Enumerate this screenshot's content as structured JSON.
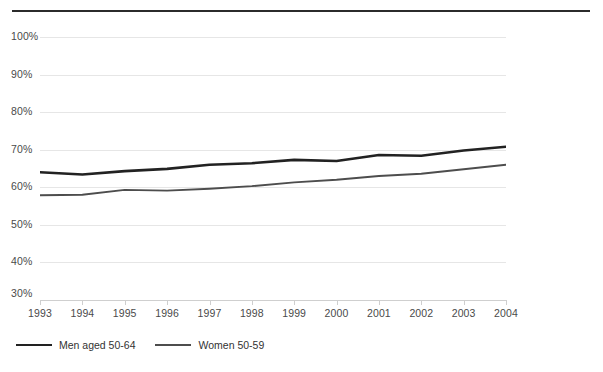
{
  "chart_data": {
    "type": "line",
    "title": "",
    "subtitle": "",
    "xlabel": "",
    "ylabel": "",
    "x": [
      1993,
      1994,
      1995,
      1996,
      1997,
      1998,
      1999,
      2000,
      2001,
      2002,
      2003,
      2004
    ],
    "xticklabels": [
      "1993",
      "1994",
      "1995",
      "1996",
      "1997",
      "1998",
      "1999",
      "2000",
      "2001",
      "2002",
      "2003",
      "2004"
    ],
    "yticklabels": [
      "100%",
      "90%",
      "80%",
      "70%",
      "60%",
      "50%",
      "40%",
      "30%"
    ],
    "yticks": [
      100,
      90,
      80,
      70,
      60,
      50,
      40,
      30
    ],
    "ylim": [
      30,
      100
    ],
    "xlim": [
      1993,
      2004
    ],
    "grid": "horizontal",
    "legend_position": "bottom-left",
    "series": [
      {
        "name": "Men aged 50-64",
        "color": "#222222",
        "width": 2.6,
        "values": [
          64.0,
          63.4,
          64.3,
          64.9,
          66.0,
          66.4,
          67.3,
          67.0,
          68.6,
          68.4,
          69.8,
          70.8
        ]
      },
      {
        "name": "Women 50-59",
        "color": "#4d4d4d",
        "width": 1.9,
        "values": [
          57.9,
          58.0,
          59.3,
          59.1,
          59.6,
          60.3,
          61.3,
          62.0,
          63.0,
          63.6,
          64.8,
          66.0
        ]
      }
    ]
  },
  "legend": {
    "items": [
      {
        "label": "Men aged 50-64"
      },
      {
        "label": "Women 50-59"
      }
    ]
  },
  "colors": {
    "rule": "#2b2b2b",
    "grid": "#e6e6e6",
    "axis": "#cfcfcf",
    "tick_text": "#4a4a4a",
    "men": "#222222",
    "women": "#4d4d4d"
  }
}
